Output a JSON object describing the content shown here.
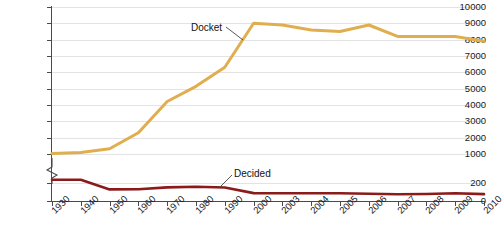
{
  "chart_data": {
    "type": "line",
    "title": "",
    "xlabel": "",
    "ylabel": "",
    "grid": true,
    "legend_position": "inline-annotations",
    "axis_break": {
      "between": [
        1000,
        200
      ],
      "note": "broken y-axis"
    },
    "yticks": [
      0,
      200,
      1000,
      2000,
      3000,
      4000,
      5000,
      6000,
      7000,
      8000,
      9000,
      10000
    ],
    "ylim": [
      0,
      10000
    ],
    "categories": [
      "1930",
      "1940",
      "1950",
      "1960",
      "1970",
      "1980",
      "1990",
      "2000",
      "2003",
      "2004",
      "2005",
      "2006",
      "2007",
      "2008",
      "2009",
      "2010"
    ],
    "series": [
      {
        "name": "Docket",
        "color": "#E0AE4E",
        "values": [
          1039,
          1100,
          1321,
          2296,
          4212,
          5144,
          6316,
          9000,
          8900,
          8600,
          8500,
          8900,
          8200,
          8200,
          8200,
          7900
        ]
      },
      {
        "name": "Decided",
        "color": "#8B1A1A",
        "values": [
          235,
          235,
          129,
          131,
          151,
          159,
          150,
          88,
          86,
          87,
          87,
          80,
          75,
          78,
          85,
          77
        ]
      }
    ]
  },
  "axis": {
    "y_tick_labels": [
      "10000",
      "9000",
      "8000",
      "7000",
      "6000",
      "5000",
      "4000",
      "3000",
      "2000",
      "1000",
      "200",
      "0"
    ],
    "x_tick_labels": [
      "1930",
      "1940",
      "1950",
      "1960",
      "1970",
      "1980",
      "1990",
      "2000",
      "2003",
      "2004",
      "2005",
      "2006",
      "2007",
      "2008",
      "2009",
      "2010"
    ]
  },
  "annotations": {
    "docket_label": "Docket",
    "decided_label": "Decided"
  }
}
